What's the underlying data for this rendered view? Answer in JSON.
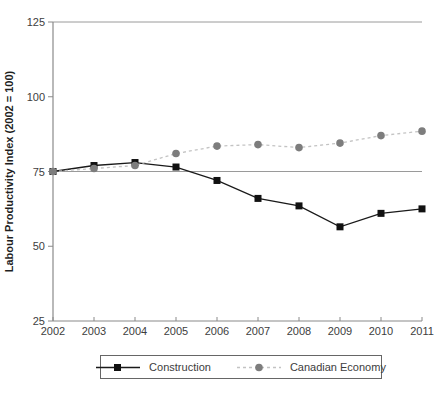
{
  "chart_data": {
    "type": "line",
    "title": "",
    "ylabel": "Labour Productivity Index (2002 = 100)",
    "xlabel": "",
    "x": [
      2002,
      2003,
      2004,
      2005,
      2006,
      2007,
      2008,
      2009,
      2010,
      2011
    ],
    "series": [
      {
        "name": "Construction",
        "values": [
          75,
          77,
          78,
          76.5,
          72,
          66,
          63.5,
          56.5,
          61,
          62.5
        ],
        "line_color": "#1a1a1a",
        "marker_color": "#111111",
        "marker": "square",
        "line_style": "solid"
      },
      {
        "name": "Canadian Economy",
        "values": [
          75,
          76,
          77,
          81,
          83.5,
          84,
          83,
          84.5,
          87,
          88.5
        ],
        "line_color": "#c3c3c3",
        "marker_color": "#7d7d7d",
        "marker": "circle",
        "line_style": "dashed"
      }
    ],
    "ylim": [
      25,
      125
    ],
    "yticks": [
      25,
      50,
      75,
      100,
      125
    ],
    "reference_lines": [
      75,
      125
    ],
    "grid": "off",
    "legend_position": "bottom",
    "axis_color": "#8a8a8a",
    "reference_line_color": "#9a9a9a",
    "tick_label_color": "#3d3d3d",
    "ylabel_color": "#1f1f1f"
  }
}
